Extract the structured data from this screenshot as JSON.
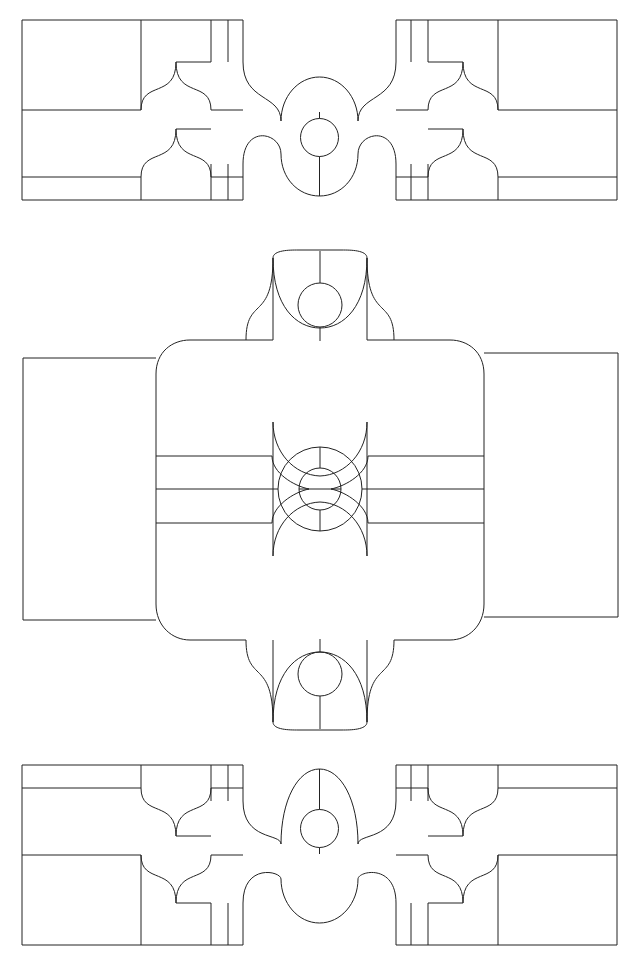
{
  "document": {
    "kind": "engineering-drawing",
    "title": "Three-View Orthographic Drawing",
    "sheet_width": 640,
    "sheet_height": 962,
    "background_color": "#ffffff",
    "line_color": "#222222",
    "line_width": 1,
    "fill": "none",
    "text_labels": [],
    "dimensions_shown": "none",
    "view_count": 3
  },
  "views": [
    {
      "id": "top-view",
      "name": "Top View (upper elevation)",
      "bounds": {
        "x": 22,
        "y": 20,
        "width": 595,
        "height": 180
      },
      "center_x": 319.5,
      "center_y": 110,
      "center_bore": {
        "cx": 319.5,
        "cy": 137,
        "r": 19
      },
      "horizontal_rules": [
        110,
        177,
        123
      ],
      "description": "Symmetric scalloped elevation with flange blocks at each end and a central circular bore"
    },
    {
      "id": "middle-view",
      "name": "Middle View (main plan / section)",
      "bounds": {
        "x": 23,
        "y": 250,
        "width": 595,
        "height": 480
      },
      "center_x": 320,
      "center_y": 489,
      "body": {
        "x": 155,
        "y": 340,
        "width": 330,
        "height": 300,
        "corner_radius": 34
      },
      "center_bore_outer": {
        "cx": 320,
        "cy": 489,
        "r": 42
      },
      "center_bore_inner": {
        "cx": 320,
        "cy": 489,
        "r": 21
      },
      "top_lobe_bore": {
        "cx": 320,
        "cy": 305,
        "r": 22
      },
      "bottom_lobe_bore": {
        "cx": 320,
        "cy": 673,
        "r": 22
      },
      "left_flange": {
        "x": 23,
        "y": 358,
        "width": 132,
        "height": 262
      },
      "right_flange": {
        "x": 485,
        "y": 353,
        "width": 133,
        "height": 264
      },
      "description": "Largest view: rounded-rectangle body with four scalloped lobes (top, bottom, left, right), concentric center bores, rectangular flanges left and right"
    },
    {
      "id": "bottom-view",
      "name": "Bottom View (lower elevation)",
      "bounds": {
        "x": 22,
        "y": 765,
        "width": 595,
        "height": 180
      },
      "center_x": 319.5,
      "center_y": 855,
      "center_bore": {
        "cx": 319.5,
        "cy": 828,
        "r": 19
      },
      "horizontal_rules": [
        855,
        788,
        842
      ],
      "description": "Mirror image of the top view: symmetric scalloped elevation with flange blocks at each end and a central circular bore"
    }
  ],
  "geometry": {
    "top_view": {
      "outer_path": "M22,20 L194,20 L194,20 L230,20 L243,20 L243,62 M243,62 C243,90 216,67 216,103 L216,110 L216,123 C216,159 243,136 243,164 L243,200 L194,200 L22,200 Z",
      "paths": [
        "M22,20 L243,20",
        "M22,20 L22,200",
        "M22,200 L243,200",
        "M22,110 L141,110",
        "M22,177 L141,177",
        "M141,20 L141,110",
        "M211,20 L211,62",
        "M228,20 L228,62",
        "M141,177 L141,200",
        "M211,164 L211,200",
        "M228,164 L228,200",
        "M141,110 C141,78 175,97 175,62 L175,62 L211,62",
        "M175,62 C175,97 211,78 211,110 L211,110",
        "M141,177 C141,145 175,164 175,129 L211,129",
        "M175,129 C175,164 211,145 211,177",
        "M243,20 L243,62",
        "M243,200 L243,164",
        "M243,62 C243,101 280,92 280,120",
        "M243,164 C243,125 280,134 280,155",
        "M280,120 C280,97 300,76 319,76",
        "M319,76 C338,76 359,97 359,120",
        "M280,155 C280,176 300,195 319,195",
        "M319,195 C338,195 359,176 359,155",
        "M359,120 C359,92 396,101 396,62",
        "M359,155 C359,134 396,125 396,164",
        "M396,20 L396,62",
        "M396,200 L396,164",
        "M396,20 L617,20",
        "M617,20 L617,200",
        "M396,200 L617,200",
        "M498,110 L617,110",
        "M498,177 L617,177",
        "M498,20 L498,110",
        "M428,20 L428,62",
        "M411,20 L411,62",
        "M498,177 L498,200",
        "M428,164 L428,200",
        "M411,164 L411,200",
        "M498,110 C498,78 464,97 464,62 L428,62",
        "M464,62 C464,97 428,78 428,110",
        "M498,177 C498,145 464,164 464,129 L428,129",
        "M464,129 C464,164 428,145 428,177"
      ],
      "circle": {
        "cx": 319.5,
        "cy": 137,
        "r": 19
      },
      "stem_lines": [
        "M319.5,111 L319.5,118",
        "M319.5,156 L319.5,195"
      ]
    },
    "middle_view": {
      "paths": [
        "M23,358 L155,358",
        "M23,358 L23,620",
        "M23,620 L155,620",
        "M485,353 L618,353",
        "M618,353 L618,617",
        "M485,617 L618,617",
        "M155,374 C155,352 171,340 189,340 L199,340",
        "M199,340 L245,340",
        "M245,340 C245,298 272,322 272,258",
        "M272,258 C272,250 288,250 296,250 L310,250",
        "M310,250 L330,250",
        "M330,250 C338,250 354,250 368,258",
        "M368,258 C368,322 395,298 395,340",
        "M395,340 L441,340",
        "M441,340 L451,340 C469,340 485,352 485,374",
        "M485,374 L485,603",
        "M155,374 L155,603",
        "M155,603 C155,625 171,640 189,640 L199,640",
        "M199,640 L245,640",
        "M245,640 C245,682 272,658 272,722",
        "M272,722 C272,730 288,730 296,730 L324,730",
        "M324,730 C338,730 354,730 368,722",
        "M368,722 C368,658 395,682 395,640",
        "M395,640 L441,640",
        "M441,640 L451,640 C469,640 485,625 485,603",
        "M245,258 L245,340",
        "M272,258 L272,340",
        "M368,258 L368,340",
        "M395,258 L395,340",
        "M245,640 L245,722",
        "M272,640 L272,722",
        "M368,640 L368,722",
        "M395,640 L395,722",
        "M155,616 L272,616",
        "M155,455 L272,455",
        "M155,489 L272,489",
        "M155,523 L272,523",
        "M368,455 L485,455",
        "M368,489 L485,489",
        "M368,523 L485,523",
        "M272,422 L272,556",
        "M368,422 L368,556",
        "M272,422 C272,455 296,476 320,476",
        "M320,476 C344,476 368,455 368,422",
        "M272,556 C272,523 296,502 320,502",
        "M320,502 C344,502 368,523 368,556",
        "M272,455 C272,472 295,487 310,489",
        "M272,523 C272,506 295,491 310,489",
        "M368,455 C368,472 345,487 330,489",
        "M368,523 C368,506 345,491 330,489"
      ],
      "circles": [
        {
          "cx": 320,
          "cy": 489,
          "r": 42,
          "name": "center-bore-outer"
        },
        {
          "cx": 320,
          "cy": 489,
          "r": 21,
          "name": "center-bore-inner"
        },
        {
          "cx": 320,
          "cy": 305,
          "r": 22,
          "name": "top-lobe-bore"
        },
        {
          "cx": 320,
          "cy": 673,
          "r": 22,
          "name": "bottom-lobe-bore"
        }
      ],
      "axis_lines": [
        "M320,283 L320,258",
        "M320,327 L320,340",
        "M320,447 L320,422",
        "M320,531 L320,556",
        "M320,651 L320,722",
        "M320,695 L320,722",
        "M278,489 L299,489",
        "M341,489 L362,489"
      ]
    },
    "bottom_view": {
      "paths": [
        "M22,765 L243,765",
        "M22,765 L22,945",
        "M22,945 L243,945",
        "M22,788 L141,788",
        "M22,855 L141,855",
        "M141,765 L141,788",
        "M211,765 L211,801",
        "M228,765 L228,801",
        "M141,855 L141,945",
        "M211,903 L211,945",
        "M228,903 L228,945",
        "M141,788 C141,820 175,801 175,836 L211,836",
        "M175,836 C175,801 211,820 211,788",
        "M141,855 C141,887 175,868 175,903 L211,903",
        "M175,903 C175,868 211,887 211,855",
        "M243,765 L243,801",
        "M243,945 L243,903",
        "M243,801 C243,840 280,831 280,845",
        "M243,903 C243,864 280,873 280,880",
        "M280,845 C280,800 300,775 319,775",
        "M319,775 C338,775 359,800 359,845",
        "M280,880 C280,900 300,920 319,920",
        "M319,920 C338,920 359,900 359,880",
        "M359,845 C359,831 396,840 396,801",
        "M359,880 C359,873 396,864 396,903",
        "M396,765 L396,801",
        "M396,945 L396,903",
        "M396,765 L617,765",
        "M617,765 L617,945",
        "M396,945 L617,945",
        "M498,788 L617,788",
        "M498,855 L617,855",
        "M498,765 L498,788",
        "M428,765 L428,801",
        "M411,765 L411,801",
        "M498,855 L498,945",
        "M428,903 L428,945",
        "M411,903 L411,945",
        "M498,788 C498,820 464,801 464,836 L428,836",
        "M464,836 C464,801 428,820 428,788",
        "M498,855 C498,887 464,868 464,903 L428,903",
        "M464,903 C464,868 428,887 428,855"
      ],
      "circle": {
        "cx": 319.5,
        "cy": 828,
        "r": 19
      },
      "stem_lines": [
        "M319.5,770 L319.5,809",
        "M319.5,847 L319.5,854"
      ]
    }
  }
}
